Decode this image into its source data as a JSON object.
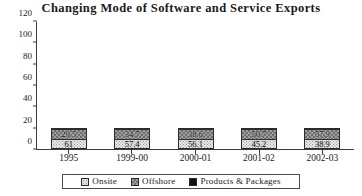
{
  "chart_data": {
    "type": "bar",
    "stacked": true,
    "title": "Changing Mode of Software and Service Exports",
    "xlabel": "",
    "ylabel": "",
    "ylim": [
      0,
      120
    ],
    "yticks": [
      0,
      20,
      40,
      60,
      80,
      100,
      120
    ],
    "ytick_labels": [
      "0",
      "20",
      "40",
      "60",
      "80",
      "100",
      "120"
    ],
    "grid": false,
    "legend_position": "bottom",
    "categories": [
      "1995",
      "1999-00",
      "2000-01",
      "2001-02",
      "2002-03"
    ],
    "series": [
      {
        "name": "Onsite",
        "values": [
          61,
          57.4,
          56.1,
          45.2,
          38.9
        ],
        "labels": [
          "61",
          "57.4",
          "56.1",
          "45.2",
          "38.9"
        ],
        "fill": "dotted-light",
        "color": "#e8e8e8"
      },
      {
        "name": "Offshore",
        "values": [
          29.5,
          34.7,
          38.6,
          50.7,
          57.9
        ],
        "labels": [
          "29.5",
          "34.7",
          "38.6",
          "50.7",
          "57.9"
        ],
        "fill": "checkered-gray",
        "color": "#9d9d9d"
      },
      {
        "name": "Products & Packages",
        "values": [
          9.5,
          7.9,
          5.3,
          4.1,
          3.2
        ],
        "labels": [
          "",
          "",
          "",
          "",
          ""
        ],
        "fill": "solid-black",
        "color": "#121212"
      }
    ]
  },
  "legend": {
    "items": [
      {
        "label": "Onsite"
      },
      {
        "label": "Offshore"
      },
      {
        "label": "Products & Packages"
      }
    ]
  }
}
